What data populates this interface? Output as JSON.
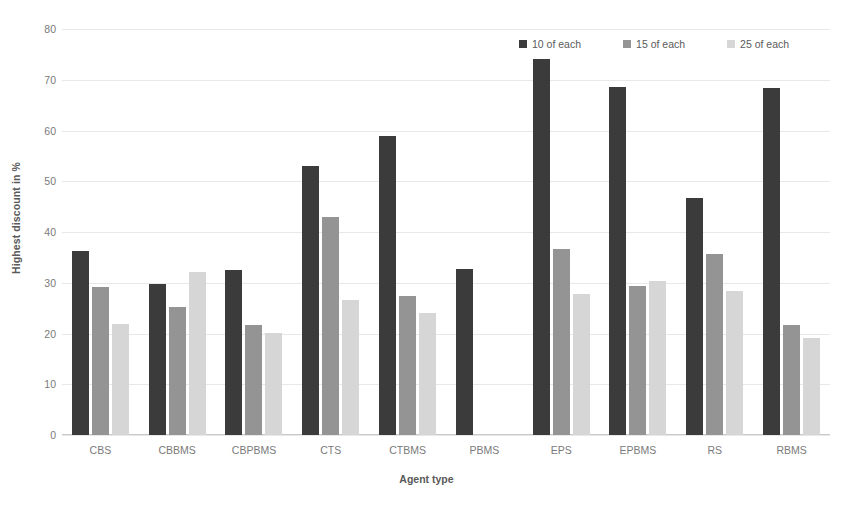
{
  "chart_data": {
    "type": "bar",
    "title": "",
    "xlabel": "Agent type",
    "ylabel": "Highest discount in %",
    "ylim": [
      0,
      80
    ],
    "yticks": [
      0,
      10,
      20,
      30,
      40,
      50,
      60,
      70,
      80
    ],
    "grid": true,
    "legend_position": "top-right",
    "categories": [
      "CBS",
      "CBBMS",
      "CBPBMS",
      "CTS",
      "CTBMS",
      "PBMS",
      "EPS",
      "EPBMS",
      "RS",
      "RBMS"
    ],
    "series": [
      {
        "name": "10 of each",
        "color": "#3b3b3b",
        "values": [
          36.3,
          29.8,
          32.6,
          53.1,
          58.9,
          32.7,
          74.0,
          68.5,
          46.8,
          68.4
        ]
      },
      {
        "name": "15 of each",
        "color": "#949494",
        "values": [
          29.2,
          25.3,
          21.6,
          43.0,
          27.4,
          null,
          36.7,
          29.3,
          35.7,
          21.6
        ]
      },
      {
        "name": "25 of each",
        "color": "#d6d6d6",
        "values": [
          21.8,
          32.1,
          20.2,
          26.7,
          24.0,
          null,
          27.8,
          30.3,
          28.4,
          19.2
        ]
      }
    ]
  },
  "axes": {
    "y_title": "Highest discount in %",
    "x_title": "Agent type",
    "y_tick_labels": [
      "80",
      "70",
      "60",
      "50",
      "40",
      "30",
      "20",
      "10",
      "0"
    ],
    "x_tick_labels": [
      "CBS",
      "CBBMS",
      "CBPBMS",
      "CTS",
      "CTBMS",
      "PBMS",
      "EPS",
      "EPBMS",
      "RS",
      "RBMS"
    ]
  },
  "legend": {
    "items": [
      {
        "label": "10 of each",
        "color": "#3b3b3b"
      },
      {
        "label": "15 of each",
        "color": "#949494"
      },
      {
        "label": "25 of each",
        "color": "#d6d6d6"
      }
    ]
  }
}
